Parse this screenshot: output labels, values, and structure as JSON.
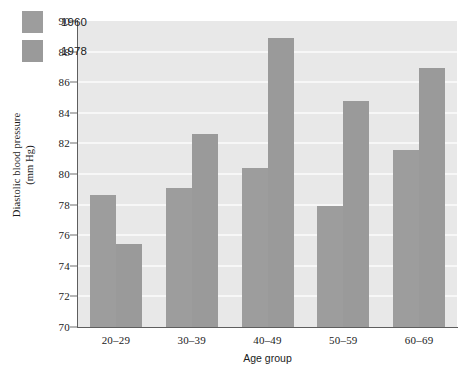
{
  "chart_data": {
    "type": "bar",
    "title": "",
    "subtitle": "",
    "xlabel": "Age group",
    "ylabel": "Diastolic blood pressure (mm Hg)",
    "ylabel_line1": "Diastolic blood pressure",
    "ylabel_line2": "(mm Hg)",
    "categories": [
      "20–29",
      "30–39",
      "40–49",
      "50–59",
      "60–69"
    ],
    "series": [
      {
        "name": "1960",
        "color": "#9d9d9d",
        "values": [
          78.6,
          79.1,
          80.4,
          77.9,
          81.6
        ]
      },
      {
        "name": "1978",
        "color": "#9a9a9a",
        "values": [
          75.4,
          82.6,
          88.9,
          84.8,
          86.9
        ]
      }
    ],
    "ylim": [
      70,
      90
    ],
    "yticks": [
      70,
      72,
      74,
      76,
      78,
      80,
      82,
      84,
      86,
      88,
      90
    ],
    "ytick_labels": [
      "70",
      "72",
      "74",
      "76",
      "78",
      "80",
      "82",
      "84",
      "86",
      "88",
      "90"
    ],
    "grid": true,
    "gridline_values": [
      72,
      74,
      76,
      78,
      80,
      82,
      84,
      86,
      88
    ],
    "grid_color": "#f7f7f7",
    "legend_position": "top-left",
    "plot_background": "#e8e8e8",
    "figure_background": "#ffffff",
    "axis_color": "#5e5e5e"
  },
  "legend": {
    "entries": [
      {
        "label": "1960",
        "color": "#9d9d9d"
      },
      {
        "label": "1978",
        "color": "#9a9a9a"
      }
    ]
  }
}
